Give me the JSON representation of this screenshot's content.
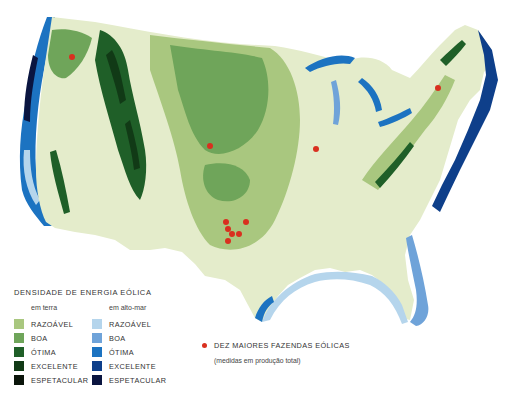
{
  "map": {
    "title": "Wind energy density map of the contiguous United States",
    "colors": {
      "land_base": "#e4eccb",
      "land_razoavel": "#a9c77f",
      "land_boa": "#6fa55a",
      "land_otima": "#1f5f28",
      "land_excelente": "#113a16",
      "land_espetacular": "#0b150b",
      "sea_razoavel": "#b5d5ec",
      "sea_boa": "#6fa3d9",
      "sea_otima": "#1c73c1",
      "sea_excelente": "#0e3f8a",
      "sea_espetacular": "#0a1540",
      "farm_dot": "#d9301f"
    },
    "wind_farms": [
      {
        "x": 72,
        "y": 57
      },
      {
        "x": 210,
        "y": 146
      },
      {
        "x": 316,
        "y": 149
      },
      {
        "x": 438,
        "y": 88
      },
      {
        "x": 226,
        "y": 222
      },
      {
        "x": 246,
        "y": 222
      },
      {
        "x": 228,
        "y": 229
      },
      {
        "x": 232,
        "y": 234
      },
      {
        "x": 239,
        "y": 234
      },
      {
        "x": 228,
        "y": 241
      }
    ]
  },
  "legend": {
    "title": "DENSIDADE DE ENERGIA EÓLICA",
    "land": {
      "heading": "em terra",
      "items": [
        {
          "label": "RAZOÁVEL",
          "color": "#a9c77f"
        },
        {
          "label": "BOA",
          "color": "#6fa55a"
        },
        {
          "label": "ÓTIMA",
          "color": "#1f5f28"
        },
        {
          "label": "EXCELENTE",
          "color": "#113a16"
        },
        {
          "label": "ESPETACULAR",
          "color": "#0b150b"
        }
      ]
    },
    "offshore": {
      "heading": "em alto-mar",
      "items": [
        {
          "label": "RAZOÁVEL",
          "color": "#b5d5ec"
        },
        {
          "label": "BOA",
          "color": "#6fa3d9"
        },
        {
          "label": "ÓTIMA",
          "color": "#1c73c1"
        },
        {
          "label": "EXCELENTE",
          "color": "#0e3f8a"
        },
        {
          "label": "ESPETACULAR",
          "color": "#0a1540"
        }
      ]
    },
    "farms": {
      "label": "DEZ MAIORES FAZENDAS EÓLICAS",
      "note": "(medidas em produção total)",
      "color": "#d9301f"
    }
  }
}
